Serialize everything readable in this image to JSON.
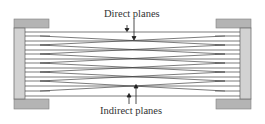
{
  "diagram": {
    "labels": {
      "direct": "Direct planes",
      "indirect": "Indirect planes"
    },
    "colors": {
      "plate_fill": "#b4b4b4",
      "plate_inner_fill": "#d2d2d2",
      "plate_stroke": "#707070",
      "line": "#444444",
      "arrow": "#222222",
      "text": "#333333"
    }
  }
}
